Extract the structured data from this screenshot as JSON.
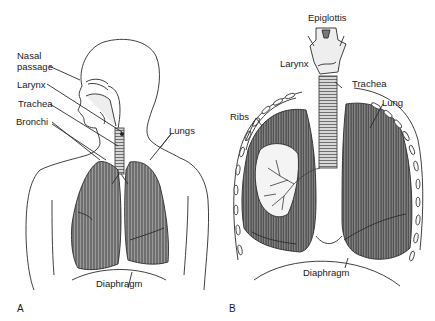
{
  "figure": {
    "panels": [
      {
        "id": "A",
        "letter": "A",
        "description": "Side view of head and torso showing respiratory tract",
        "labels": {
          "nasal_line1": "Nasal",
          "nasal_line2": "passage",
          "larynx": "Larynx",
          "trachea": "Trachea",
          "bronchi": "Bronchi",
          "lungs": "Lungs",
          "diaphragm": "Diaphragm"
        }
      },
      {
        "id": "B",
        "letter": "B",
        "description": "Frontal view of larynx, trachea, lungs and rib cage",
        "labels": {
          "epiglottis": "Epiglottis",
          "larynx": "Larynx",
          "trachea": "Trachea",
          "lung": "Lung",
          "ribs": "Ribs",
          "diaphragm": "Diaphragm"
        }
      }
    ],
    "colors": {
      "line": "#2a2a2a",
      "lung_fill": "#7a7a7a",
      "lung_dark": "#4a4a4a",
      "background": "#ffffff"
    }
  }
}
